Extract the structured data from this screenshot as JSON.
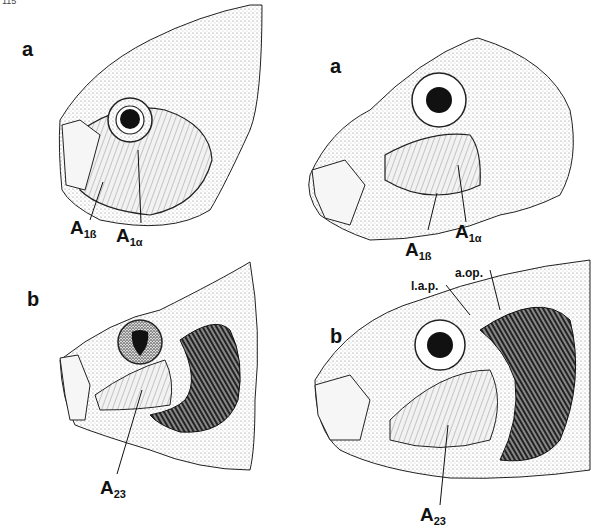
{
  "figure": {
    "corner_text": "115",
    "panels": [
      {
        "id": "top-left",
        "label": "a",
        "muscles": [
          {
            "main": "A",
            "sub": "1ß"
          },
          {
            "main": "A",
            "sub": "1α"
          }
        ]
      },
      {
        "id": "top-right",
        "label": "a",
        "muscles": [
          {
            "main": "A",
            "sub": "1ß"
          },
          {
            "main": "A",
            "sub": "1α"
          }
        ]
      },
      {
        "id": "bottom-left",
        "label": "b",
        "muscles": [
          {
            "main": "A",
            "sub": "23"
          }
        ]
      },
      {
        "id": "bottom-right",
        "label": "b",
        "muscles": [
          {
            "main": "A",
            "sub": "23"
          }
        ],
        "annotations": [
          "l.a.p.",
          "a.op."
        ]
      }
    ]
  },
  "colors": {
    "ink": "#111111",
    "paper": "#ffffff",
    "stipple": "#9a9a9a"
  }
}
